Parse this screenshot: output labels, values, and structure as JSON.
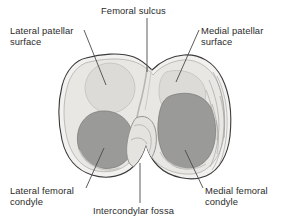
{
  "figure": {
    "background_color": "#ffffff",
    "labels": {
      "femoral_sulcus": "Femoral sulcus",
      "lateral_patellar_surface_line1": "Lateral patellar",
      "lateral_patellar_surface_line2": "surface",
      "medial_patellar_surface_line1": "Medial patellar",
      "medial_patellar_surface_line2": "surface",
      "lateral_femoral_condyle_line1": "Lateral femoral",
      "lateral_femoral_condyle_line2": "condyle",
      "medial_femoral_condyle_line1": "Medial femoral",
      "medial_femoral_condyle_line2": "condyle",
      "intercondylar_fossa": "Intercondylar fossa"
    },
    "colors": {
      "text": "#2b2b2b",
      "outline": "#3a3a3a",
      "bone_fill": "#f2f1ef",
      "bone_inner": "#e6e5e2",
      "patellar_surface": "#d8d7d4",
      "condyle_cartilage": "#9a9a98",
      "leader_line": "#4a4a4a",
      "shadow": "#c9c8c5"
    }
  }
}
